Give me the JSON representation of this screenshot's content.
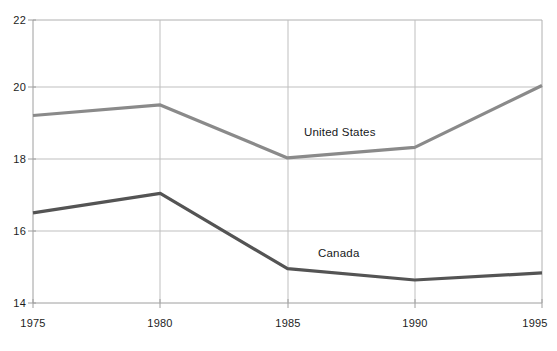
{
  "chart_data": {
    "type": "line",
    "title": "",
    "subtitle": "",
    "xlabel": "",
    "ylabel": "",
    "x": [
      1975,
      1980,
      1985,
      1990,
      1995
    ],
    "xtick_labels": [
      "1975",
      "1980",
      "1985",
      "1990",
      "1995"
    ],
    "ytick_labels": [
      "14",
      "16",
      "18",
      "20",
      "22"
    ],
    "yticks": [
      14,
      16,
      18,
      20,
      22
    ],
    "xlim": [
      1975,
      1995
    ],
    "ylim": [
      14,
      22
    ],
    "grid": true,
    "grid_axes": "both",
    "legend": "inline-labels",
    "series": [
      {
        "name": "United States",
        "color": "#8a8a8a",
        "label_x": 1987.2,
        "label_y": 18.85,
        "values": [
          19.3,
          19.6,
          18.1,
          18.4,
          20.15
        ]
      },
      {
        "name": "Canada",
        "color": "#545454",
        "label_x": 1988.0,
        "label_y": 15.5,
        "values": [
          16.55,
          17.1,
          14.97,
          14.65,
          14.85
        ]
      }
    ],
    "annotations": [
      {
        "text": "United States",
        "x": 1987.2,
        "y": 18.85
      },
      {
        "text": "Canada",
        "x": 1988.0,
        "y": 15.5
      }
    ],
    "axis_color": "#9a9a9a",
    "grid_color": "#b9b9b9",
    "background": "#ffffff"
  },
  "axes": {
    "y_ticks": [
      {
        "label": "22",
        "value": 22
      },
      {
        "label": "20",
        "value": 20
      },
      {
        "label": "18",
        "value": 18
      },
      {
        "label": "16",
        "value": 16
      },
      {
        "label": "14",
        "value": 14
      }
    ],
    "x_ticks": [
      {
        "label": "1975",
        "value": 1975
      },
      {
        "label": "1980",
        "value": 1980
      },
      {
        "label": "1985",
        "value": 1985
      },
      {
        "label": "1990",
        "value": 1990
      },
      {
        "label": "1995",
        "value": 1995
      }
    ]
  }
}
